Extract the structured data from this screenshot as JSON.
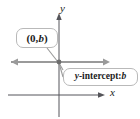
{
  "figure": {
    "name": "y-intercept-coordinate-plane-diagram",
    "background_color": "#ffffff"
  },
  "axes": {
    "y_label": "y",
    "x_label": "x",
    "axis_color": "#55555a",
    "origin": {
      "x": 59,
      "y": 62
    }
  },
  "graph_line": {
    "description": "horizontal line through y-intercept",
    "color": "#9a9a9a",
    "arrow_left": true,
    "arrow_right": true
  },
  "point_marker": {
    "label": "y-intercept point",
    "color": "#6e6e6e"
  },
  "callouts": [
    {
      "id": "point-coordinates",
      "text_plain": "(0, b)",
      "prefix": "(0, ",
      "variable": "b",
      "suffix": ")",
      "border_color": "#b9b9b9",
      "fill_color": "#ffffff"
    },
    {
      "id": "y-intercept-label",
      "text_plain": "y-intercept: b",
      "prefix": "y",
      "middle": "-intercept: ",
      "variable": "b",
      "border_color": "#b9b9b9",
      "fill_color": "#ffffff"
    }
  ]
}
